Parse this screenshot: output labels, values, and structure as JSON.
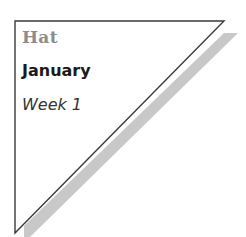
{
  "card": {
    "category": "Hat",
    "month": "January",
    "week": "Week 1"
  },
  "colors": {
    "outline": "#3a3a3a",
    "shadow": "#c8c8c8",
    "category_text": "#8c8c8c",
    "month_text": "#1a1a1a",
    "week_text": "#333333",
    "background": "#ffffff"
  }
}
